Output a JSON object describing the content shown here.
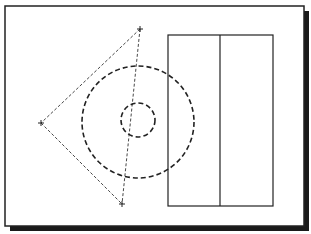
{
  "diagram": {
    "frame": {
      "x": 5,
      "y": 6,
      "w": 299,
      "h": 220,
      "shadow": 5,
      "stroke": "#222222"
    },
    "points": [
      {
        "name": "top",
        "x": 140,
        "y": 29
      },
      {
        "name": "left",
        "x": 41,
        "y": 123
      },
      {
        "name": "bottom",
        "x": 122,
        "y": 204
      }
    ],
    "circles": [
      {
        "name": "outer",
        "cx": 138,
        "cy": 122,
        "r": 56
      },
      {
        "name": "inner",
        "cx": 138,
        "cy": 120,
        "r": 17
      }
    ],
    "rectangle": {
      "x": 168,
      "y": 35,
      "w": 105,
      "h": 171,
      "divider_x": 220
    },
    "colors": {
      "line": "#222222",
      "background": "#ffffff"
    }
  }
}
